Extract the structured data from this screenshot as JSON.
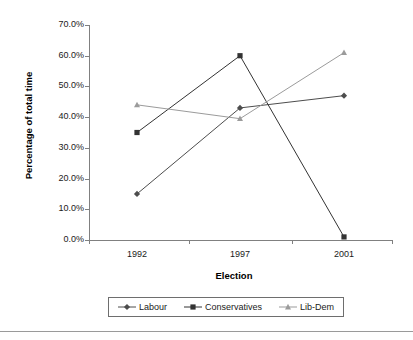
{
  "chart_data": {
    "type": "line",
    "title": "",
    "xlabel": "Election",
    "ylabel": "Percentage of total time",
    "categories": [
      "1992",
      "1997",
      "2001"
    ],
    "x_tick_labels": [
      "1992",
      "1997",
      "2001"
    ],
    "y_tick_labels": [
      "0.0%",
      "10.0%",
      "20.0%",
      "30.0%",
      "40.0%",
      "50.0%",
      "60.0%",
      "70.0%"
    ],
    "y_tick_values": [
      0,
      10,
      20,
      30,
      40,
      50,
      60,
      70
    ],
    "ylim": [
      0,
      70
    ],
    "grid": false,
    "legend_position": "bottom",
    "series": [
      {
        "name": "Labour",
        "marker": "diamond",
        "color": "#4d4d4d",
        "values": [
          15.0,
          43.0,
          47.0
        ]
      },
      {
        "name": "Conservatives",
        "marker": "square",
        "color": "#333333",
        "values": [
          35.0,
          60.0,
          1.0
        ]
      },
      {
        "name": "Lib-Dem",
        "marker": "triangle",
        "color": "#9b9b9b",
        "values": [
          44.0,
          39.5,
          61.0
        ]
      }
    ]
  },
  "legend": {
    "items": [
      {
        "label": "Labour"
      },
      {
        "label": "Conservatives"
      },
      {
        "label": "Lib-Dem"
      }
    ]
  },
  "axis_colors": {
    "axis_line": "#808080",
    "text": "#1a1a1a"
  }
}
